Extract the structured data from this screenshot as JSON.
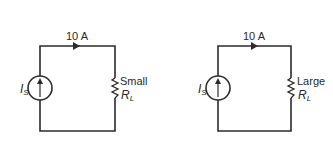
{
  "circuits": [
    {
      "current_label": "10 A",
      "source_label": "I",
      "source_sub": "S",
      "load_size": "Small",
      "load_label": "R",
      "load_sub": "L"
    },
    {
      "current_label": "10 A",
      "source_label": "I",
      "source_sub": "S",
      "load_size": "Large",
      "load_label": "R",
      "load_sub": "L"
    }
  ],
  "colors": {
    "wire": "#2b2b2b",
    "background": "#ffffff"
  }
}
